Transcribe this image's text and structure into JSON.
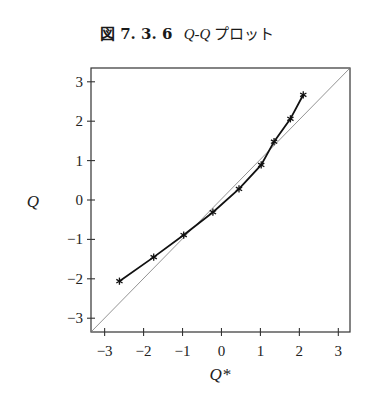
{
  "figure": {
    "number_label": "図 7. 3. 6",
    "title_q": "Q-Q",
    "title_rest": " プロット"
  },
  "chart_data": {
    "type": "line",
    "xlabel": "Q*",
    "ylabel": "Q",
    "xlim": [
      -3.35,
      3.3
    ],
    "ylim": [
      -3.35,
      3.35
    ],
    "xticks": [
      -3,
      -2,
      -1,
      0,
      1,
      2,
      3
    ],
    "yticks": [
      -3,
      -2,
      -1,
      0,
      1,
      2,
      3
    ],
    "xtick_labels": [
      "−3",
      "−2",
      "−1",
      "0",
      "1",
      "2",
      "3"
    ],
    "ytick_labels": [
      "−3",
      "−2",
      "−1",
      "0",
      "1",
      "2",
      "3"
    ],
    "grid": false,
    "series": [
      {
        "name": "sample quantiles",
        "marker": "asterisk",
        "x": [
          -2.62,
          -1.74,
          -0.97,
          -0.22,
          0.45,
          1.02,
          1.35,
          1.77,
          2.1
        ],
        "y": [
          -2.06,
          -1.45,
          -0.89,
          -0.31,
          0.28,
          0.89,
          1.48,
          2.06,
          2.67
        ]
      },
      {
        "name": "reference line y = x",
        "style": "thin",
        "x": [
          -3.35,
          3.3
        ],
        "y": [
          -3.35,
          3.35
        ]
      }
    ]
  }
}
